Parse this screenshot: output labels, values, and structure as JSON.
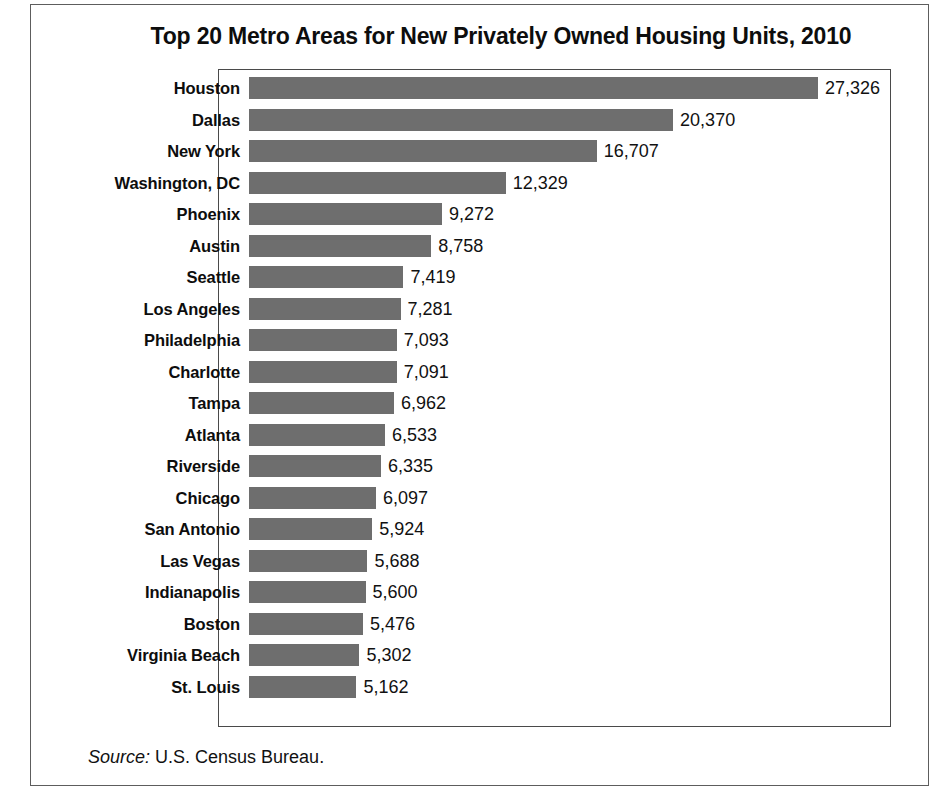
{
  "chart_data": {
    "type": "bar",
    "orientation": "horizontal",
    "title": "Top 20 Metro Areas for New Privately Owned Housing Units, 2010",
    "xlabel": "",
    "ylabel": "",
    "grid": false,
    "legend": false,
    "xlim": [
      0,
      32000
    ],
    "categories": [
      "Houston",
      "Dallas",
      "New York",
      "Washington, DC",
      "Phoenix",
      "Austin",
      "Seattle",
      "Los Angeles",
      "Philadelphia",
      "Charlotte",
      "Tampa",
      "Atlanta",
      "Riverside",
      "Chicago",
      "San Antonio",
      "Las Vegas",
      "Indianapolis",
      "Boston",
      "Virginia Beach",
      "St. Louis"
    ],
    "values": [
      27326,
      20370,
      16707,
      12329,
      9272,
      8758,
      7419,
      7281,
      7093,
      7091,
      6962,
      6533,
      6335,
      6097,
      5924,
      5688,
      5600,
      5476,
      5302,
      5162
    ],
    "value_labels": [
      "27,326",
      "20,370",
      "16,707",
      "12,329",
      "9,272",
      "8,758",
      "7,419",
      "7,281",
      "7,093",
      "7,091",
      "6,962",
      "6,533",
      "6,335",
      "6,097",
      "5,924",
      "5,688",
      "5,600",
      "5,476",
      "5,302",
      "5,162"
    ],
    "bar_color": "#6e6e6e"
  },
  "source": {
    "label": "Source:",
    "text": " U.S. Census Bureau."
  }
}
